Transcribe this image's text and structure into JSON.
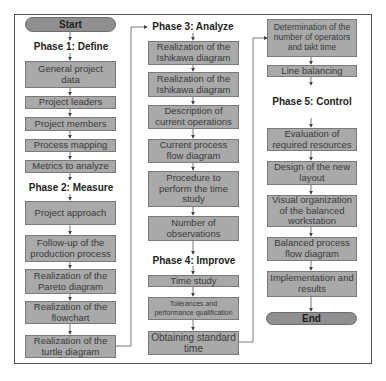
{
  "diagram": {
    "type": "flowchart",
    "columns": [
      {
        "nodes": [
          {
            "id": "start",
            "kind": "terminal",
            "label": "Start"
          },
          {
            "id": "phase1",
            "kind": "phase",
            "label": "Phase 1: Define"
          },
          {
            "id": "c1n1",
            "kind": "process",
            "label": "General project data"
          },
          {
            "id": "c1n2",
            "kind": "process",
            "label": "Project leaders"
          },
          {
            "id": "c1n3",
            "kind": "process",
            "label": "Project members"
          },
          {
            "id": "c1n4",
            "kind": "process",
            "label": "Process mapping"
          },
          {
            "id": "c1n5",
            "kind": "process",
            "label": "Metrics to analyze"
          },
          {
            "id": "phase2",
            "kind": "phase",
            "label": "Phase 2: Measure"
          },
          {
            "id": "c1n6",
            "kind": "process",
            "label": "Project approach"
          },
          {
            "id": "c1n7",
            "kind": "process",
            "label": "Follow-up of the production process"
          },
          {
            "id": "c1n8",
            "kind": "process",
            "label": "Realization of the Pareto diagram"
          },
          {
            "id": "c1n9",
            "kind": "process",
            "label": "Realization of the flowchart"
          },
          {
            "id": "c1n10",
            "kind": "process",
            "label": "Realization of the turtle diagram"
          }
        ]
      },
      {
        "nodes": [
          {
            "id": "phase3",
            "kind": "phase",
            "label": "Phase 3: Analyze"
          },
          {
            "id": "c2n1",
            "kind": "process",
            "label": "Realization of the Ishikawa diagram"
          },
          {
            "id": "c2n2",
            "kind": "process",
            "label": "Realization of the Ishikawa diagram"
          },
          {
            "id": "c2n3",
            "kind": "process",
            "label": "Description of current operations"
          },
          {
            "id": "c2n4",
            "kind": "process",
            "label": "Current process flow diagram"
          },
          {
            "id": "c2n5",
            "kind": "process",
            "label": "Procedure to perform the time study"
          },
          {
            "id": "c2n6",
            "kind": "process",
            "label": "Number of observations"
          },
          {
            "id": "phase4",
            "kind": "phase",
            "label": "Phase 4: Improve"
          },
          {
            "id": "c2n7",
            "kind": "process",
            "label": "Time study"
          },
          {
            "id": "c2n8",
            "kind": "process",
            "label": "Tolerances and performance qualification"
          },
          {
            "id": "c2n9",
            "kind": "process",
            "label": "Obtaining standard time"
          }
        ]
      },
      {
        "nodes": [
          {
            "id": "c3n1",
            "kind": "process",
            "label": "Determination of the number of operators and takt time"
          },
          {
            "id": "c3n2",
            "kind": "process",
            "label": "Line balancing"
          },
          {
            "id": "phase5",
            "kind": "phase",
            "label": "Phase 5: Control"
          },
          {
            "id": "c3n3",
            "kind": "process",
            "label": "Evaluation of required resources"
          },
          {
            "id": "c3n4",
            "kind": "process",
            "label": "Design of the new layout"
          },
          {
            "id": "c3n5",
            "kind": "process",
            "label": "Visual organization of the balanced workstation"
          },
          {
            "id": "c3n6",
            "kind": "process",
            "label": "Balanced process flow diagram"
          },
          {
            "id": "c3n7",
            "kind": "process",
            "label": "Implementation and results"
          },
          {
            "id": "end",
            "kind": "terminal",
            "label": "End"
          }
        ]
      }
    ],
    "colors": {
      "process_fill": "#a9a9a9",
      "terminal_fill": "#8f8f8f",
      "phase_fill": "#d9d9d9",
      "line": "#555555"
    }
  }
}
